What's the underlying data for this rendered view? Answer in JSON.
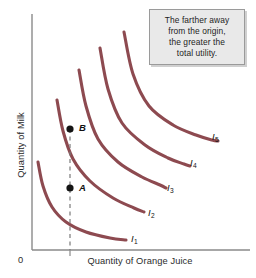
{
  "figure": {
    "background_color": "#ffffff",
    "curve_color": "#8d4a50",
    "axis_color": "#8a8a8a",
    "point_color": "#141414",
    "dashed_color": "#7a7a7a"
  },
  "callout": {
    "lines": [
      "The farther away",
      "from the origin,",
      "the greater the",
      "total utility."
    ],
    "background_color": "#e9e9e9",
    "border_color": "#9a9a9a"
  },
  "chart_data": {
    "type": "line",
    "title": "",
    "subtitle": "",
    "xlabel": "Quantity of Orange Juice",
    "ylabel": "Quantity of Milk",
    "origin_label": "0",
    "grid": false,
    "legend_position": "inline-curve-end",
    "annotation": "The farther away from the origin, the greater the total utility.",
    "axis_ranges": {
      "x": [
        0,
        1
      ],
      "y": [
        0,
        1
      ]
    },
    "tick_labels": {
      "x": [],
      "y": []
    },
    "series": [
      {
        "name": "I1",
        "label": "I",
        "subscript": "1",
        "label_position": {
          "x": 131,
          "y": 233
        },
        "points": [
          [
            38,
            162
          ],
          [
            43,
            186
          ],
          [
            52,
            207
          ],
          [
            66,
            222
          ],
          [
            86,
            232
          ],
          [
            110,
            238
          ],
          [
            126,
            240
          ]
        ]
      },
      {
        "name": "I2",
        "label": "I",
        "subscript": "2",
        "label_position": {
          "x": 148,
          "y": 207
        },
        "points": [
          [
            57,
            100
          ],
          [
            63,
            131
          ],
          [
            73,
            159
          ],
          [
            90,
            181
          ],
          [
            113,
            198
          ],
          [
            134,
            208
          ],
          [
            144,
            212
          ]
        ]
      },
      {
        "name": "I3",
        "label": "I",
        "subscript": "3",
        "label_position": {
          "x": 167,
          "y": 182
        },
        "points": [
          [
            79,
            70
          ],
          [
            86,
            106
          ],
          [
            98,
            139
          ],
          [
            118,
            162
          ],
          [
            142,
            177
          ],
          [
            160,
            185
          ],
          [
            166,
            188
          ]
        ]
      },
      {
        "name": "I4",
        "label": "I",
        "subscript": "4",
        "label_position": {
          "x": 190,
          "y": 157
        },
        "points": [
          [
            100,
            48
          ],
          [
            108,
            89
          ],
          [
            122,
            123
          ],
          [
            145,
            145
          ],
          [
            168,
            158
          ],
          [
            184,
            164
          ],
          [
            190,
            166
          ]
        ]
      },
      {
        "name": "I5",
        "label": "I",
        "subscript": "5",
        "label_position": {
          "x": 212,
          "y": 131
        },
        "points": [
          [
            124,
            32
          ],
          [
            133,
            74
          ],
          [
            149,
            106
          ],
          [
            173,
            125
          ],
          [
            196,
            135
          ],
          [
            212,
            140
          ],
          [
            218,
            141
          ]
        ]
      }
    ],
    "marked_points": [
      {
        "name": "B",
        "label": "B",
        "x": 70,
        "y": 129,
        "label_x": 79,
        "label_y": 122
      },
      {
        "name": "A",
        "label": "A",
        "x": 70,
        "y": 188,
        "label_x": 79,
        "label_y": 182
      }
    ],
    "dashed_guide": {
      "x": 70,
      "y_top": 129,
      "y_bottom": 250
    }
  }
}
